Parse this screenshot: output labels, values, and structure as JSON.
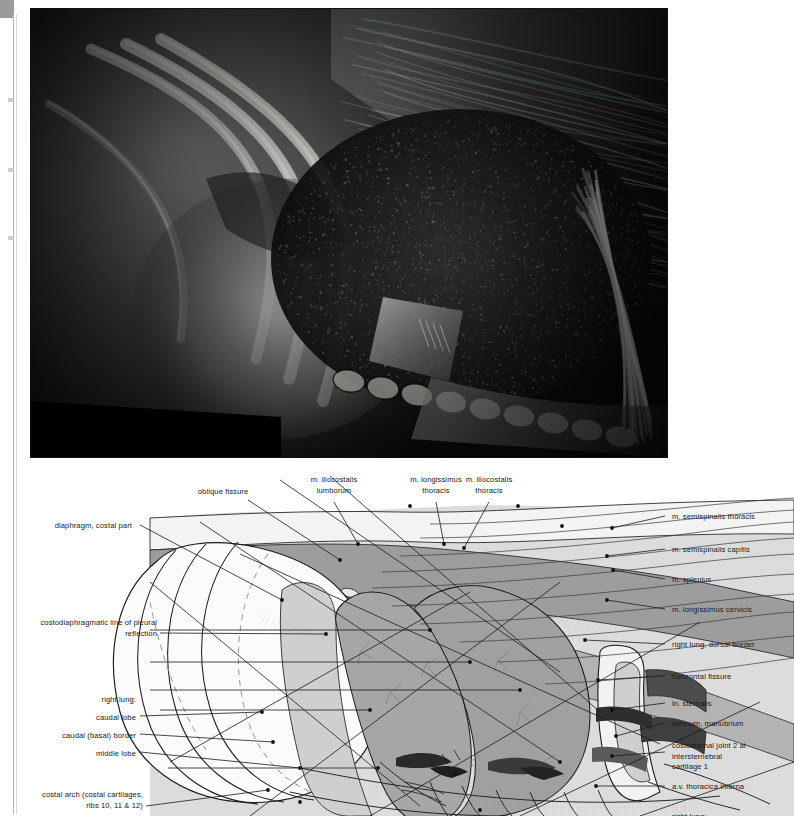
{
  "plate": {
    "photo": {
      "caption": "",
      "description": "Dissected right thoracic wall, lateral view: ribs reflected, right lung and diaphragm exposed",
      "frame_color": "#050505"
    },
    "diagram": {
      "description": "Key line drawing of the photograph above with leader lines to numbered structures",
      "lung_fill": "#f4f4f4",
      "muscle_fill": "#9a9a9a",
      "muscle_fill_light": "#bcbcbc",
      "background_fill": "#d6d6d6",
      "line_color": "#1a1a1a",
      "vessel_dark": "#4a4a4a"
    }
  },
  "labels": {
    "top": [
      {
        "id": "oblique-fissure",
        "text": "oblique fissure",
        "align": "center",
        "x": 223,
        "y": 487,
        "lead": [
          [
            248,
            500
          ],
          [
            340,
            560
          ]
        ]
      },
      {
        "id": "m-iliocostalis-lumborum",
        "text": "m. iliocostalis\nlumborum",
        "align": "center",
        "x": 334,
        "y": 475,
        "lead": [
          [
            334,
            502
          ],
          [
            358,
            544
          ]
        ]
      },
      {
        "id": "m-longissimus-thoracis",
        "text": "m. longissimus\nthoracis",
        "align": "center",
        "x": 436,
        "y": 475,
        "lead": [
          [
            436,
            502
          ],
          [
            444,
            544
          ]
        ]
      },
      {
        "id": "m-iliocostalis-thoracis",
        "text": "m. iliocostalis\nthoracis",
        "align": "center",
        "x": 489,
        "y": 475,
        "lead": [
          [
            489,
            502
          ],
          [
            464,
            548
          ]
        ]
      }
    ],
    "left": [
      {
        "id": "diaphragm-costal-part",
        "text": "diaphragm, costal part",
        "align": "right",
        "x": 132,
        "y": 521,
        "lead": [
          [
            140,
            525
          ],
          [
            282,
            600
          ]
        ]
      },
      {
        "id": "costodiaphragmatic-line",
        "text": "costodiaphragmatic line of pleural\nreflection",
        "align": "right",
        "x": 157,
        "y": 618,
        "lead": [
          [
            160,
            633
          ],
          [
            326,
            634
          ]
        ]
      },
      {
        "id": "right-lung-heading",
        "text": "right lung:",
        "align": "right",
        "x": 136,
        "y": 695,
        "lead": null
      },
      {
        "id": "caudal-lobe",
        "text": "caudal lobe",
        "align": "right",
        "x": 136,
        "y": 713,
        "lead": [
          [
            140,
            716
          ],
          [
            262,
            712
          ]
        ]
      },
      {
        "id": "caudal-basal-border",
        "text": "caudal (basal) border",
        "align": "right",
        "x": 136,
        "y": 731,
        "lead": [
          [
            140,
            734
          ],
          [
            273,
            742
          ]
        ]
      },
      {
        "id": "middle-lobe",
        "text": "middle lobe",
        "align": "right",
        "x": 136,
        "y": 749,
        "lead": [
          [
            140,
            752
          ],
          [
            300,
            768
          ]
        ]
      },
      {
        "id": "costal-arch",
        "text": "costal arch (costal cartilages,\nribs 10, 11 & 12)",
        "align": "right",
        "x": 143,
        "y": 790,
        "lead": [
          [
            146,
            806
          ],
          [
            268,
            790
          ]
        ]
      }
    ],
    "right": [
      {
        "id": "m-semispinalis-thoracis",
        "text": "m. semispinalis thoracis",
        "align": "left",
        "x": 672,
        "y": 512,
        "lead": [
          [
            665,
            516
          ],
          [
            612,
            528
          ]
        ]
      },
      {
        "id": "m-semispinalis-capitis",
        "text": "m. semispinalis capitis",
        "align": "left",
        "x": 672,
        "y": 545,
        "lead": [
          [
            665,
            549
          ],
          [
            607,
            556
          ]
        ]
      },
      {
        "id": "m-splenius",
        "text": "m. splenius",
        "align": "left",
        "x": 672,
        "y": 575,
        "lead": [
          [
            665,
            579
          ],
          [
            613,
            570
          ]
        ]
      },
      {
        "id": "m-longissimus-cervicis",
        "text": "m. longissimus cervicis",
        "align": "left",
        "x": 672,
        "y": 605,
        "lead": [
          [
            665,
            609
          ],
          [
            607,
            600
          ]
        ]
      },
      {
        "id": "right-lung-dorsal-border",
        "text": "right lung, dorsal border",
        "align": "left",
        "x": 672,
        "y": 640,
        "lead": [
          [
            665,
            644
          ],
          [
            585,
            640
          ]
        ]
      },
      {
        "id": "horizontal-fissure",
        "text": "horizontal fissure",
        "align": "left",
        "x": 672,
        "y": 672,
        "lead": [
          [
            665,
            676
          ],
          [
            598,
            680
          ]
        ]
      },
      {
        "id": "ln-sternalis",
        "text": "ln. sternalis",
        "align": "left",
        "x": 672,
        "y": 699,
        "lead": [
          [
            665,
            703
          ],
          [
            612,
            710
          ]
        ]
      },
      {
        "id": "sternum-manubrium",
        "text": "sternum, manubrium",
        "align": "left",
        "x": 672,
        "y": 719,
        "lead": [
          [
            665,
            723
          ],
          [
            616,
            736
          ]
        ]
      },
      {
        "id": "costosternal-joint-2",
        "text": "costosternal joint 2 at intersternebral\ncartilage 1",
        "align": "left",
        "x": 672,
        "y": 741,
        "lead": [
          [
            665,
            752
          ],
          [
            612,
            756
          ]
        ]
      },
      {
        "id": "av-thoracica-interna",
        "text": "a.v. thoracica interna",
        "align": "left",
        "x": 672,
        "y": 782,
        "lead": [
          [
            665,
            786
          ],
          [
            596,
            786
          ]
        ]
      },
      {
        "id": "right-lung-cropped",
        "text": "right lung:",
        "align": "left",
        "x": 672,
        "y": 812,
        "lead": null
      }
    ]
  }
}
